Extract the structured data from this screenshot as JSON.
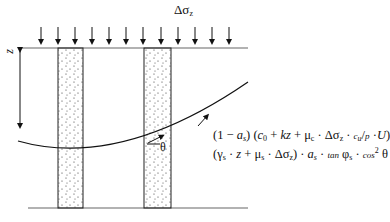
{
  "diagram": {
    "load_label": "Δσz",
    "depth_label": "z",
    "angle_label": "θ",
    "formula_line1": "(1 − as) (c0 + kz + μc · Δσz · cu/p · U)",
    "formula_line2": "(γs · z + μs · Δσz) · as · tan φs · cos² θ",
    "load_arrow_count": 12,
    "columns": 2
  }
}
